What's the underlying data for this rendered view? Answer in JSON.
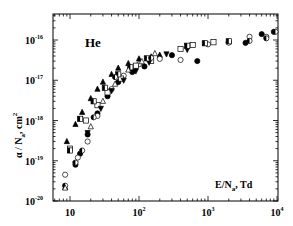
{
  "chart_data": {
    "type": "scatter",
    "title": "",
    "annotation": "He",
    "xlabel": "E/N_a, Td",
    "ylabel": "α / N_a, cm^2",
    "xscale": "log",
    "yscale": "log",
    "xlim": [
      5,
      10000
    ],
    "ylim": [
      1e-20,
      5e-16
    ],
    "grid": false,
    "legend": null,
    "x_ticks": [
      "10",
      "10^2",
      "10^3",
      "10^4"
    ],
    "y_ticks": [
      "10^-20",
      "10^-19",
      "10^-18",
      "10^-17",
      "10^-16"
    ],
    "series": [
      {
        "name": "filled triangle up",
        "marker": "triangle-up",
        "filled": true,
        "points": [
          [
            8.5,
            2.2e-20
          ],
          [
            9,
            3e-19
          ],
          [
            12,
            8e-19
          ],
          [
            15,
            1.6e-18
          ],
          [
            20,
            3.5e-18
          ],
          [
            25,
            6e-18
          ],
          [
            30,
            9e-18
          ],
          [
            40,
            1.4e-17
          ],
          [
            50,
            2e-17
          ],
          [
            70,
            2.6e-17
          ],
          [
            100,
            3.4e-17
          ],
          [
            150,
            3.8e-17
          ],
          [
            200,
            4.2e-17
          ]
        ]
      },
      {
        "name": "filled circle",
        "marker": "circle",
        "filled": true,
        "points": [
          [
            12,
            8e-20
          ],
          [
            14,
            1.5e-19
          ],
          [
            18,
            4.5e-19
          ],
          [
            25,
            1.5e-18
          ],
          [
            35,
            4e-18
          ],
          [
            50,
            9e-18
          ],
          [
            80,
            1.6e-17
          ],
          [
            120,
            2.2e-17
          ],
          [
            300,
            4.2e-17
          ],
          [
            700,
            3e-17
          ],
          [
            2000,
            9e-17
          ],
          [
            3500,
            8.5e-17
          ],
          [
            6000,
            1.4e-16
          ],
          [
            9000,
            1.6e-16
          ]
        ]
      },
      {
        "name": "open circle",
        "marker": "circle",
        "filled": false,
        "points": [
          [
            8.5,
            4.5e-20
          ],
          [
            13,
            1.2e-19
          ],
          [
            18,
            3e-19
          ],
          [
            25,
            1.3e-18
          ],
          [
            40,
            6e-18
          ],
          [
            60,
            1.3e-17
          ],
          [
            100,
            2.5e-17
          ],
          [
            200,
            3.4e-17
          ],
          [
            400,
            3.2e-17
          ],
          [
            1000,
            7.8e-17
          ],
          [
            2000,
            8.6e-17
          ],
          [
            4000,
            1.2e-16
          ],
          [
            7000,
            1.2e-16
          ]
        ]
      },
      {
        "name": "open square",
        "marker": "square",
        "filled": false,
        "points": [
          [
            10,
            2e-19
          ],
          [
            17,
            1e-18
          ],
          [
            25,
            2.4e-18
          ],
          [
            35,
            5e-18
          ],
          [
            55,
            1.1e-17
          ],
          [
            90,
            2.3e-17
          ],
          [
            150,
            3e-17
          ],
          [
            400,
            6e-17
          ],
          [
            600,
            7.5e-17
          ],
          [
            1200,
            8.8e-17
          ]
        ]
      },
      {
        "name": "filled triangle down",
        "marker": "triangle-down",
        "filled": true,
        "points": [
          [
            12,
            8.5e-20
          ],
          [
            18,
            5e-19
          ],
          [
            28,
            2e-18
          ],
          [
            40,
            5.5e-18
          ],
          [
            60,
            1e-17
          ],
          [
            90,
            1.7e-17
          ],
          [
            140,
            2.8e-17
          ],
          [
            250,
            4.5e-17
          ],
          [
            500,
            5.8e-17
          ]
        ]
      },
      {
        "name": "half-filled square",
        "marker": "square-half",
        "filled": true,
        "points": [
          [
            10,
            1.8e-19
          ],
          [
            14,
            1.1e-18
          ],
          [
            22,
            3e-18
          ],
          [
            32,
            6.5e-18
          ],
          [
            50,
            1.4e-17
          ],
          [
            75,
            2.1e-17
          ],
          [
            130,
            3.5e-17
          ],
          [
            500,
            7.2e-17
          ],
          [
            900,
            8.3e-17
          ],
          [
            2000,
            9.3e-17
          ]
        ]
      },
      {
        "name": "half-filled circle",
        "marker": "circle-half",
        "filled": true,
        "points": [
          [
            8.5,
            2.4e-20
          ],
          [
            12,
            9e-20
          ],
          [
            15,
            1.8e-19
          ],
          [
            22,
            1.2e-18
          ],
          [
            45,
            1.2e-17
          ],
          [
            150,
            3.6e-17
          ],
          [
            4000,
            9.5e-17
          ],
          [
            7000,
            1.1e-16
          ],
          [
            9500,
            1.6e-16
          ]
        ]
      },
      {
        "name": "open triangle up",
        "marker": "triangle-up",
        "filled": false,
        "points": [
          [
            8.5,
            2.1e-20
          ],
          [
            20,
            7e-19
          ],
          [
            30,
            3e-18
          ],
          [
            45,
            8e-18
          ],
          [
            70,
            1.8e-17
          ],
          [
            110,
            2.9e-17
          ],
          [
            170,
            4.6e-17
          ]
        ]
      }
    ]
  },
  "plot": {
    "frame": {
      "left": 53,
      "top": 14,
      "right": 278,
      "bottom": 201
    },
    "x_decades_px": {
      "1": 70,
      "2": 139,
      "3": 207,
      "4": 277
    },
    "y_decades_px": {
      "-16": 40,
      "-17": 80,
      "-18": 121,
      "-19": 161,
      "-20": 201
    }
  },
  "labels": {
    "annotation": "He",
    "xlabel_main": "E/N",
    "xlabel_sub": "a",
    "xlabel_tail": ", Td",
    "ylabel_main": "α / N",
    "ylabel_sub": "a",
    "ylabel_tail": ", cm",
    "ylabel_sup": "2",
    "xtick_base": "10",
    "ytick_base": "10"
  }
}
